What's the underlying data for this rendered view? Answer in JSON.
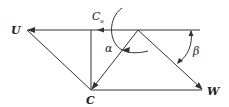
{
  "diagram": {
    "type": "velocity-triangle",
    "labels": {
      "u": "U",
      "c": "C",
      "w": "W",
      "cu_main": "C",
      "cu_sub": "u",
      "alpha": "α",
      "beta": "β"
    },
    "vectors": [
      {
        "name": "U",
        "description": "peripheral velocity, horizontal, pointing left"
      },
      {
        "name": "C",
        "description": "absolute velocity"
      },
      {
        "name": "W",
        "description": "relative velocity"
      },
      {
        "name": "Cu",
        "description": "tangential component of absolute velocity"
      }
    ],
    "angles": [
      {
        "name": "α",
        "between": "C and U direction"
      },
      {
        "name": "β",
        "between": "W and reference line"
      }
    ],
    "colors": {
      "stroke": "#333333",
      "text": "#222222",
      "background": "#ffffff"
    }
  }
}
